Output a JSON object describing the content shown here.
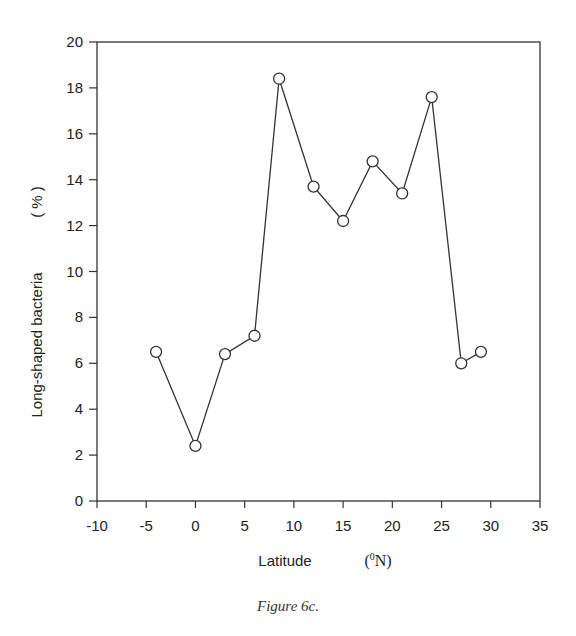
{
  "chart_data": {
    "type": "line",
    "title": "",
    "caption": "Figure 6c.",
    "xlabel": "Latitude",
    "xlabel_unit": "(⁰N)",
    "ylabel": "Long-shaped bacteria",
    "ylabel_unit": "( % )",
    "xlim": [
      -10,
      35
    ],
    "ylim": [
      0,
      20
    ],
    "xticks": [
      -10,
      -5,
      0,
      5,
      10,
      15,
      20,
      25,
      30,
      35
    ],
    "yticks": [
      0,
      2,
      4,
      6,
      8,
      10,
      12,
      14,
      16,
      18,
      20
    ],
    "grid": false,
    "legend": null,
    "marker": "open-circle",
    "series": [
      {
        "name": "Long-shaped bacteria",
        "x": [
          -4,
          0,
          3,
          6,
          8.5,
          12,
          15,
          18,
          21,
          24,
          27,
          29
        ],
        "y": [
          6.5,
          2.4,
          6.4,
          7.2,
          18.4,
          13.7,
          12.2,
          14.8,
          13.4,
          17.6,
          6.0,
          6.5
        ]
      }
    ]
  },
  "labels": {
    "xlabel": "Latitude",
    "xunit_open": "(",
    "xunit_sup": "0",
    "xunit_close": "N)",
    "ylabel": "Long-shaped bacteria",
    "yunit": "( % )",
    "caption": "Figure 6c."
  }
}
